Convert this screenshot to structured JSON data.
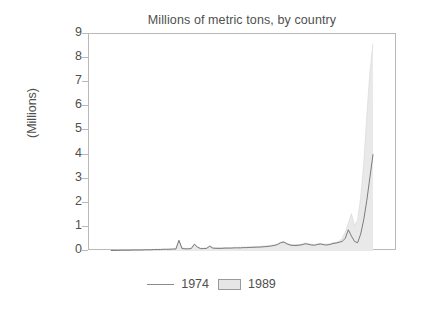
{
  "chart_data": {
    "type": "area",
    "title": "Millions of metric tons, by country",
    "xlabel": "",
    "ylabel": "(Millions)",
    "ylim": [
      0,
      9
    ],
    "yticks": [
      0,
      1,
      2,
      3,
      4,
      5,
      6,
      7,
      8,
      9
    ],
    "ytick_labels": [
      "0",
      "1",
      "2",
      "3",
      "4",
      "5",
      "6",
      "7",
      "8",
      "9"
    ],
    "xticks": [],
    "xtick_labels": [],
    "grid": false,
    "legend_position": "bottom-center",
    "legend": [
      "1974",
      "1989"
    ],
    "series": [
      {
        "name": "1989",
        "style": "filled-area",
        "fill_color": "#e9e9e9",
        "x": [
          0,
          1,
          2,
          3,
          4,
          5,
          6,
          7,
          8,
          9,
          10,
          11,
          12,
          13,
          14,
          15,
          16,
          17,
          18,
          19,
          20,
          21,
          22,
          23,
          24,
          25,
          26,
          27,
          28,
          29,
          30,
          31,
          32,
          33,
          34,
          35,
          36,
          37,
          38,
          39,
          40,
          41,
          42,
          43,
          44,
          45,
          46,
          47,
          48,
          49,
          50,
          51,
          52,
          53,
          54,
          55,
          56,
          57,
          58,
          59,
          60,
          61,
          62,
          63,
          64,
          65,
          66,
          67,
          68,
          69,
          70,
          71,
          72,
          73,
          74,
          75,
          76,
          77,
          78,
          79,
          80,
          81,
          82,
          83,
          84,
          85
        ],
        "values": [
          0.02,
          0.02,
          0.03,
          0.03,
          0.03,
          0.04,
          0.04,
          0.04,
          0.05,
          0.05,
          0.05,
          0.06,
          0.06,
          0.06,
          0.07,
          0.07,
          0.08,
          0.08,
          0.08,
          0.09,
          0.09,
          0.1,
          0.46,
          0.13,
          0.11,
          0.11,
          0.12,
          0.3,
          0.18,
          0.12,
          0.12,
          0.13,
          0.22,
          0.14,
          0.13,
          0.13,
          0.13,
          0.14,
          0.14,
          0.14,
          0.15,
          0.15,
          0.16,
          0.16,
          0.17,
          0.17,
          0.18,
          0.18,
          0.19,
          0.2,
          0.21,
          0.22,
          0.24,
          0.26,
          0.3,
          0.36,
          0.4,
          0.33,
          0.28,
          0.26,
          0.26,
          0.27,
          0.29,
          0.33,
          0.31,
          0.28,
          0.27,
          0.3,
          0.32,
          0.29,
          0.28,
          0.3,
          0.34,
          0.36,
          0.4,
          0.52,
          0.78,
          1.15,
          1.55,
          1.05,
          1.28,
          2.2,
          3.6,
          5.6,
          7.4,
          8.6
        ]
      },
      {
        "name": "1974",
        "style": "line",
        "line_color": "#6e6e6e",
        "x": [
          0,
          1,
          2,
          3,
          4,
          5,
          6,
          7,
          8,
          9,
          10,
          11,
          12,
          13,
          14,
          15,
          16,
          17,
          18,
          19,
          20,
          21,
          22,
          23,
          24,
          25,
          26,
          27,
          28,
          29,
          30,
          31,
          32,
          33,
          34,
          35,
          36,
          37,
          38,
          39,
          40,
          41,
          42,
          43,
          44,
          45,
          46,
          47,
          48,
          49,
          50,
          51,
          52,
          53,
          54,
          55,
          56,
          57,
          58,
          59,
          60,
          61,
          62,
          63,
          64,
          65,
          66,
          67,
          68,
          69,
          70,
          71,
          72,
          73,
          74,
          75,
          76,
          77,
          78,
          79,
          80,
          81,
          82,
          83,
          84,
          85
        ],
        "values": [
          0.02,
          0.02,
          0.02,
          0.03,
          0.03,
          0.03,
          0.03,
          0.04,
          0.04,
          0.04,
          0.04,
          0.05,
          0.05,
          0.05,
          0.06,
          0.06,
          0.06,
          0.07,
          0.07,
          0.07,
          0.08,
          0.08,
          0.44,
          0.1,
          0.09,
          0.09,
          0.1,
          0.28,
          0.16,
          0.1,
          0.1,
          0.11,
          0.2,
          0.12,
          0.11,
          0.11,
          0.11,
          0.12,
          0.12,
          0.12,
          0.13,
          0.13,
          0.13,
          0.14,
          0.14,
          0.15,
          0.15,
          0.16,
          0.16,
          0.17,
          0.18,
          0.19,
          0.21,
          0.23,
          0.27,
          0.34,
          0.37,
          0.3,
          0.25,
          0.23,
          0.23,
          0.24,
          0.26,
          0.3,
          0.28,
          0.25,
          0.24,
          0.27,
          0.29,
          0.26,
          0.25,
          0.27,
          0.31,
          0.33,
          0.36,
          0.4,
          0.52,
          0.88,
          0.62,
          0.4,
          0.34,
          0.7,
          1.3,
          2.1,
          3.05,
          4.0
        ]
      }
    ],
    "data_x_start_fraction": 0.072,
    "data_x_end_fraction": 0.922,
    "annotations": []
  },
  "colors": {
    "area_fill": "#e9e9e9",
    "line": "#6e6e6e",
    "axis": "#b9b9b9",
    "text": "#4f4f4f",
    "background": "#ffffff"
  },
  "legend_items": [
    {
      "label": "1974",
      "marker": "line"
    },
    {
      "label": "1989",
      "marker": "box"
    }
  ]
}
